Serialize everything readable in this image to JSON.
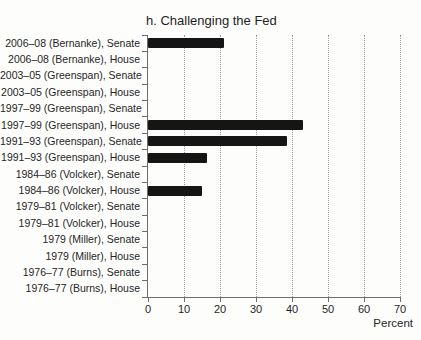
{
  "chart_data": {
    "type": "bar",
    "orientation": "horizontal",
    "title": "h. Challenging the Fed",
    "xlabel": "Percent",
    "ylabel": "",
    "xlim": [
      0,
      70
    ],
    "xticks": [
      0,
      10,
      20,
      30,
      40,
      50,
      60,
      70
    ],
    "grid": "dotted-vertical-at-10-through-70",
    "legend": "none",
    "bar_color": "#151515",
    "axis_color": "#6e6e6e",
    "categories": [
      "2006–08 (Bernanke), Senate",
      "2006–08 (Bernanke), House",
      "2003–05 (Greenspan), Senate",
      "2003–05 (Greenspan), House",
      "1997–99 (Greenspan), Senate",
      "1997–99 (Greenspan), House",
      "1991–93 (Greenspan), Senate",
      "1991–93 (Greenspan), House",
      "1984–86 (Volcker), Senate",
      "1984–86 (Volcker), House",
      "1979–81 (Volcker), Senate",
      "1979–81 (Volcker), House",
      "1979 (Miller), Senate",
      "1979 (Miller), House",
      "1976–77 (Burns), Senate",
      "1976–77 (Burns), House"
    ],
    "values": [
      21,
      0,
      0,
      0,
      0,
      43,
      38.5,
      16.5,
      0,
      15,
      0,
      0,
      0,
      0,
      0,
      0
    ]
  }
}
